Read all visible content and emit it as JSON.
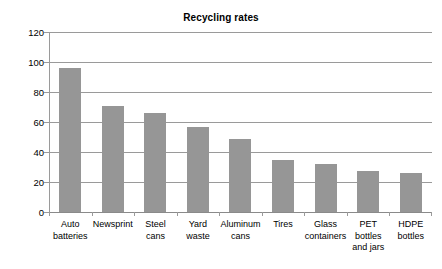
{
  "chart_data": {
    "type": "bar",
    "title": "Recycling rates",
    "xlabel": "",
    "ylabel": "",
    "ylim": [
      0,
      120
    ],
    "yticks": [
      0,
      20,
      40,
      60,
      80,
      100,
      120
    ],
    "ytick_labels": [
      "0",
      "20",
      "40",
      "60",
      "80",
      "100",
      "120"
    ],
    "grid": true,
    "legend": false,
    "bar_color": "#969696",
    "categories": [
      "Auto batteries",
      "Newsprint",
      "Steel cans",
      "Yard waste",
      "Aluminum cans",
      "Tires",
      "Glass containers",
      "PET bottles and jars",
      "HDPE bottles"
    ],
    "category_lines": [
      [
        "Auto",
        "batteries"
      ],
      [
        "Newsprint"
      ],
      [
        "Steel",
        "cans"
      ],
      [
        "Yard",
        "waste"
      ],
      [
        "Aluminum",
        "cans"
      ],
      [
        "Tires"
      ],
      [
        "Glass",
        "containers"
      ],
      [
        "PET",
        "bottles",
        "and jars"
      ],
      [
        "HDPE",
        "bottles"
      ]
    ],
    "values": [
      96,
      71,
      66,
      56.5,
      48.5,
      34.5,
      32,
      27.5,
      26
    ]
  }
}
